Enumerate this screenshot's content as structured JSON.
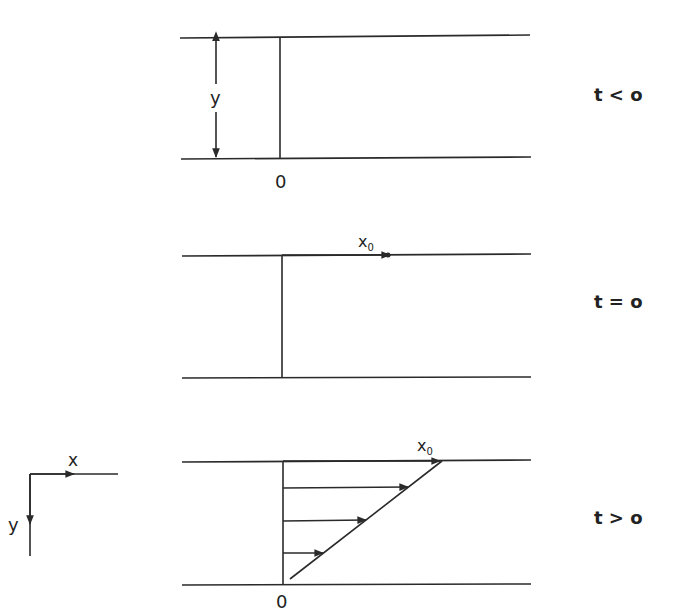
{
  "diagram": {
    "type": "shear-flow-velocity-profile",
    "colors": {
      "line": "#2a2a2a",
      "text": "#222222",
      "background": "#ffffff"
    },
    "axes": {
      "x_label": "x",
      "y_label": "y"
    },
    "panels": [
      {
        "id": "before",
        "time_label": "t < o",
        "dimension_label": "y",
        "origin_label": "0"
      },
      {
        "id": "start",
        "time_label": "t = o",
        "marker_label": "x",
        "marker_subscript": "0"
      },
      {
        "id": "after",
        "time_label": "t > o",
        "marker_label": "x",
        "marker_subscript": "0",
        "origin_label": "0",
        "velocity_arrows": 3
      }
    ]
  }
}
